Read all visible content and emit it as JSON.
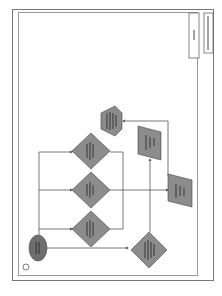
{
  "diagram": {
    "orientation": "rotated-90-ccw",
    "colors": {
      "shape_fill": "#8c8c8c",
      "start_fill": "#6e6e6e",
      "line": "#555555",
      "border": "#777777"
    },
    "title_block": {
      "label_1": "Page",
      "label_2": "Process Flow"
    },
    "page_marker": "①",
    "nodes": [
      {
        "id": "start",
        "shape": "ellipse"
      },
      {
        "id": "d1",
        "shape": "diamond"
      },
      {
        "id": "d2",
        "shape": "diamond"
      },
      {
        "id": "d3",
        "shape": "diamond"
      },
      {
        "id": "d4",
        "shape": "diamond"
      },
      {
        "id": "io1",
        "shape": "parallelogram"
      },
      {
        "id": "io2",
        "shape": "parallelogram"
      },
      {
        "id": "end",
        "shape": "hexagon"
      }
    ]
  }
}
